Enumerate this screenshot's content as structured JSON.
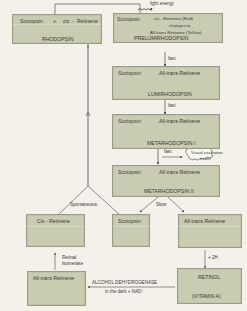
{
  "rhodopsin": {
    "scotopsin": "Scotopsin",
    "plus": "+",
    "cis": "cis",
    "dash": "-",
    "retinene": "Retinene",
    "name": "RHODOPSIN"
  },
  "light_energy": "light energy",
  "prelumirhodopsin": {
    "scotopsin": "Scotopsin",
    "line1": "cis - Retinene (Red)",
    "line2": "changes to",
    "line3": "All-trans Retinene (Yellow)",
    "name": "PRELUMIRHODOPSIN"
  },
  "fast1": "fast",
  "lumirhodopsin": {
    "scotopsin": "Scotopsin",
    "retinene": "All-trans Retinene",
    "name": "LUMIRHODOPSIN"
  },
  "fast2": "fast",
  "metarhodopsin1": {
    "scotopsin": "Scotopsin",
    "retinene": "All-trans Retinene",
    "name": "METARHODOPSIN I"
  },
  "fast3": "fast",
  "visual_excitation": {
    "line1": "Visual excitation",
    "line2": "event"
  },
  "metarhodopsin2": {
    "scotopsin": "Scotopsin",
    "retinene": "All-trans Retinene",
    "name": "METARHODOPSIN II"
  },
  "slow": "Slow",
  "spontaneous": "Spontaneous",
  "cis_retinene": "Cis - Retinene",
  "scotopsin_free": "Scotopsin",
  "all_trans_free": "All-trans Retinene",
  "minus_2h": "+ 2H",
  "retinal_isomerase": {
    "line1": "Retinal",
    "line2": "isomerase"
  },
  "all_trans_bottom": "All-trans Retinene",
  "alcohol_dehydrogenase": {
    "line1": "ALCOHOL DEHYDROGENASE",
    "line2": "in the dark + NAD⁺"
  },
  "retinol": {
    "name": "RETINOL",
    "alt": "(VITAMIN A)"
  },
  "colors": {
    "box_fill": "#c9ccb1",
    "box_border": "#9a9c86",
    "background": "#f3f1ea",
    "line": "#4a4a44"
  }
}
